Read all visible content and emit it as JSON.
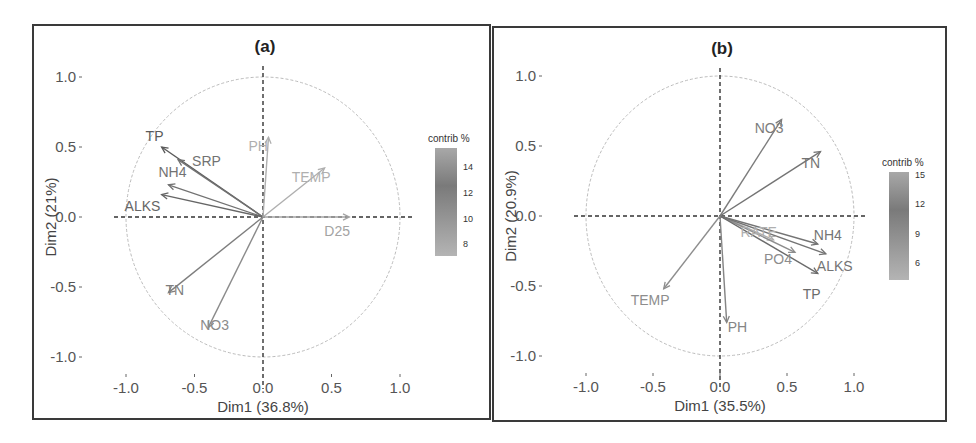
{
  "chart_data": [
    {
      "type": "pca_variable_correlation_circle",
      "title": "(a)",
      "xlabel": "Dim1 (36.8%)",
      "ylabel": "Dim2 (21%)",
      "xlim": [
        -1.0,
        1.0
      ],
      "ylim": [
        -1.0,
        1.0
      ],
      "x_ticks": [
        "-1.0",
        "-0.5",
        "0.0",
        "0.5",
        "1.0"
      ],
      "y_ticks": [
        "1.0",
        "0.5",
        "0.0",
        "-0.5",
        "-1.0"
      ],
      "unit_circle": true,
      "reference_lines": "dashed at x=0 and y=0",
      "legend": {
        "title": "contrib %",
        "type": "gradient",
        "ticks": [
          "14",
          "12",
          "10",
          "8"
        ],
        "position": "right"
      },
      "variables": [
        {
          "name": "TP",
          "x": -0.74,
          "y": 0.5,
          "contrib": 14
        },
        {
          "name": "SRP",
          "x": -0.62,
          "y": 0.41,
          "contrib": 12
        },
        {
          "name": "NH4",
          "x": -0.69,
          "y": 0.23,
          "contrib": 12
        },
        {
          "name": "ALKS",
          "x": -0.74,
          "y": 0.16,
          "contrib": 13
        },
        {
          "name": "PH",
          "x": 0.04,
          "y": 0.57,
          "contrib": 7
        },
        {
          "name": "TEMP",
          "x": 0.45,
          "y": 0.35,
          "contrib": 7
        },
        {
          "name": "D25",
          "x": 0.63,
          "y": 0.0,
          "contrib": 8
        },
        {
          "name": "TN",
          "x": -0.69,
          "y": -0.54,
          "contrib": 11
        },
        {
          "name": "NO3",
          "x": -0.4,
          "y": -0.79,
          "contrib": 10
        }
      ]
    },
    {
      "type": "pca_variable_correlation_circle",
      "title": "(b)",
      "xlabel": "Dim1 (35.5%)",
      "ylabel": "Dim2 (20.9%)",
      "xlim": [
        -1.0,
        1.0
      ],
      "ylim": [
        -1.0,
        1.0
      ],
      "x_ticks": [
        "-1.0",
        "-0.5",
        "0.0",
        "0.5",
        "1.0"
      ],
      "y_ticks": [
        "1.0",
        "0.5",
        "0.0",
        "-0.5",
        "-1.0"
      ],
      "unit_circle": true,
      "reference_lines": "dashed at x=0 and y=0",
      "legend": {
        "title": "contrib %",
        "type": "gradient",
        "ticks": [
          "15",
          "12",
          "9",
          "6"
        ],
        "position": "right"
      },
      "variables": [
        {
          "name": "NO3",
          "x": 0.46,
          "y": 0.69,
          "contrib": 11
        },
        {
          "name": "TN",
          "x": 0.75,
          "y": 0.46,
          "contrib": 12
        },
        {
          "name": "RATE",
          "x": 0.4,
          "y": -0.17,
          "contrib": 5
        },
        {
          "name": "NH4",
          "x": 0.73,
          "y": -0.2,
          "contrib": 12
        },
        {
          "name": "PO4",
          "x": 0.56,
          "y": -0.26,
          "contrib": 9
        },
        {
          "name": "ALKS",
          "x": 0.79,
          "y": -0.27,
          "contrib": 12
        },
        {
          "name": "TP",
          "x": 0.73,
          "y": -0.41,
          "contrib": 13
        },
        {
          "name": "TEMP",
          "x": -0.42,
          "y": -0.52,
          "contrib": 9
        },
        {
          "name": "PH",
          "x": 0.05,
          "y": -0.76,
          "contrib": 10
        }
      ]
    }
  ],
  "panels": {
    "a": {
      "title": "(a)",
      "xlabel": "Dim1 (36.8%)",
      "ylabel": "Dim2 (21%)",
      "legend_title": "contrib %"
    },
    "b": {
      "title": "(b)",
      "xlabel": "Dim1 (35.5%)",
      "ylabel": "Dim2 (20.9%)",
      "legend_title": "contrib %"
    }
  }
}
